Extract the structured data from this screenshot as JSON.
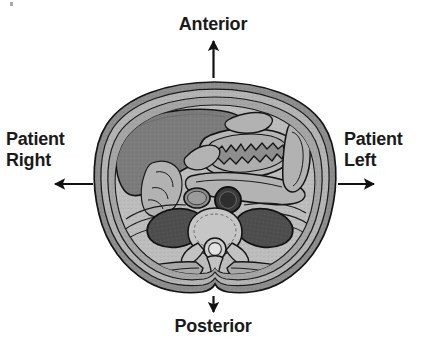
{
  "figure": {
    "type": "anatomical-cross-section",
    "plane": "transverse",
    "background_color": "#ffffff",
    "line_color": "#1a1a1a"
  },
  "labels": {
    "anterior": "Anterior",
    "posterior": "Posterior",
    "patient_right": "Patient\nRight",
    "patient_left": "Patient\nLeft"
  },
  "arrows": {
    "anterior": "arrow-up-icon",
    "posterior": "arrow-down-icon",
    "patient_right": "arrow-left-icon",
    "patient_left": "arrow-right-icon"
  },
  "palette": {
    "skin": "#8f8f8f",
    "subcutaneous_fat": "#b8b8b8",
    "muscle_wall": "#a3a3a3",
    "abdominal_cavity": "#bdbdbd",
    "liver": "#7e7e7e",
    "kidney": "#4f4f4f",
    "aorta": "#3a3a3a",
    "ivc": "#8a8a8a",
    "vertebra": "#c7c7c7",
    "spinal_cord": "#dcdcdc",
    "bowel": "#b0b0b0",
    "stomach": "#b5b5b5",
    "outline": "#1a1a1a"
  },
  "structures": [
    {
      "name": "body-wall",
      "label": "Body wall"
    },
    {
      "name": "subcutaneous-fat",
      "label": "Subcutaneous fat"
    },
    {
      "name": "liver",
      "label": "Liver"
    },
    {
      "name": "stomach",
      "label": "Stomach"
    },
    {
      "name": "bowel-loops",
      "label": "Bowel loops"
    },
    {
      "name": "kidney-right",
      "label": "Right kidney"
    },
    {
      "name": "kidney-left",
      "label": "Left kidney"
    },
    {
      "name": "aorta",
      "label": "Aorta"
    },
    {
      "name": "inferior-vena-cava",
      "label": "Inferior vena cava"
    },
    {
      "name": "vertebral-body",
      "label": "Vertebral body"
    },
    {
      "name": "spinal-cord",
      "label": "Spinal cord"
    },
    {
      "name": "paraspinal-muscle",
      "label": "Paraspinal muscles"
    }
  ]
}
